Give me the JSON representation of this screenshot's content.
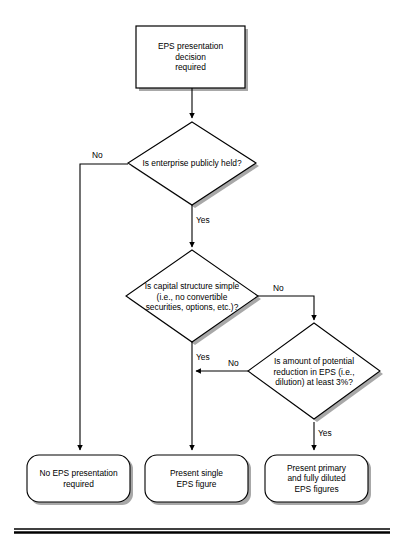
{
  "diagram": {
    "title_node": {
      "id": "start-box",
      "text": "EPS presentation\ndecision\nrequired"
    },
    "decisions": [
      {
        "id": "decision-publicly-held",
        "text": "Is enterprise publicly held?",
        "yes_label": "Yes",
        "no_label": "No"
      },
      {
        "id": "decision-capital-structure",
        "text": "Is capital structure simple\n(i.e., no convertible\nsecurities, options, etc.)?",
        "yes_label": "Yes",
        "no_label": "No"
      },
      {
        "id": "decision-dilution",
        "text": "Is amount  of potential\nreduction in EPS (i.e.,\ndilution) at least 3%?",
        "yes_label": "Yes",
        "no_label": "No"
      }
    ],
    "terminals": [
      {
        "id": "terminal-no-eps",
        "text": "No EPS presentation\nrequired"
      },
      {
        "id": "terminal-single-eps",
        "text": "Present single\nEPS figure"
      },
      {
        "id": "terminal-primary-diluted",
        "text": "Present primary\nand fully diluted\nEPS figures"
      }
    ],
    "colors": {
      "stroke": "#000000",
      "fill": "#ffffff",
      "shadow": "#a6a6a6",
      "rule": "#000000"
    }
  }
}
